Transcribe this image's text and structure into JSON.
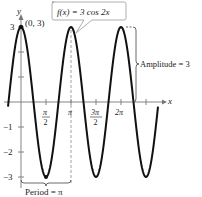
{
  "chart_data": {
    "type": "line",
    "title": "",
    "function_label": "f(x) = 3 cos 2x",
    "xlabel": "x",
    "ylabel": "y",
    "series": [
      {
        "name": "f(x) = 3 cos 2x",
        "expression": "3*cos(2x)",
        "color": "#111111"
      }
    ],
    "x_ticks": [
      "π/2",
      "π",
      "3π/2",
      "2π"
    ],
    "x_tick_values": [
      1.5708,
      3.1416,
      4.7124,
      6.2832
    ],
    "y_ticks": [
      "3",
      "-1",
      "-2",
      "-3"
    ],
    "y_tick_values": [
      3,
      -1,
      -2,
      -3
    ],
    "xlim": [
      -0.8,
      9.0
    ],
    "ylim": [
      -3.3,
      3.3
    ],
    "grid": false,
    "legend": "none",
    "annotations": [
      {
        "text": "(0, 3)",
        "x": 0,
        "y": 3,
        "type": "point"
      },
      {
        "text": "Amplitude = 3",
        "type": "brace",
        "from_y": 0,
        "to_y": 3
      },
      {
        "text": "Period = π",
        "type": "brace",
        "from_x": 0,
        "to_x": 3.1416
      },
      {
        "text": "f(x) = 3 cos 2x",
        "type": "callout"
      }
    ],
    "key_points": [
      {
        "x": 0,
        "y": 3
      },
      {
        "x": 1.5708,
        "y": -3
      },
      {
        "x": 3.1416,
        "y": 3
      },
      {
        "x": 4.7124,
        "y": -3
      },
      {
        "x": 6.2832,
        "y": 3
      },
      {
        "x": 7.854,
        "y": -3
      }
    ]
  },
  "labels": {
    "y_axis": "y",
    "x_axis": "x",
    "point": "(0, 3)",
    "callout": "f(x) = 3 cos 2x",
    "amplitude": "Amplitude = 3",
    "period": "Period = π",
    "tick_3": "3",
    "tick_m1": "−1",
    "tick_m2": "−2",
    "tick_m3": "−3",
    "pi": "π",
    "two": "2",
    "three_pi": "3π",
    "two_pi": "2π"
  }
}
